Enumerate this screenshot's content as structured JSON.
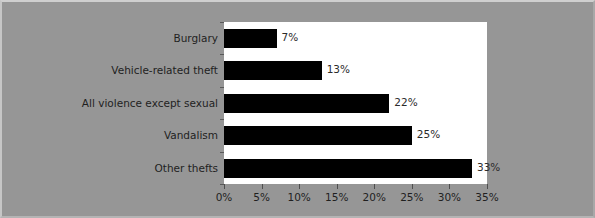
{
  "chart_data": {
    "type": "bar",
    "orientation": "horizontal",
    "title": "",
    "subtitle": "",
    "xlabel": "",
    "ylabel": "",
    "categories": [
      "Burglary",
      "Vehicle-related theft",
      "All violence except sexual",
      "Vandalism",
      "Other thefts"
    ],
    "values": [
      7,
      13,
      22,
      25,
      33
    ],
    "value_labels": [
      "7%",
      "13%",
      "22%",
      "25%",
      "33%"
    ],
    "xlim": [
      0,
      35
    ],
    "xticks": [
      0,
      5,
      10,
      15,
      20,
      25,
      30,
      35
    ],
    "xtick_labels": [
      "0%",
      "5%",
      "10%",
      "15%",
      "20%",
      "25%",
      "30%",
      "35%"
    ],
    "grid": false,
    "legend": "none",
    "colors": {
      "bar": "#000000",
      "plot_background": "#ffffff",
      "figure_background": "#969696",
      "text": "#1f1f1f",
      "axis": "#4f4f4f"
    }
  }
}
